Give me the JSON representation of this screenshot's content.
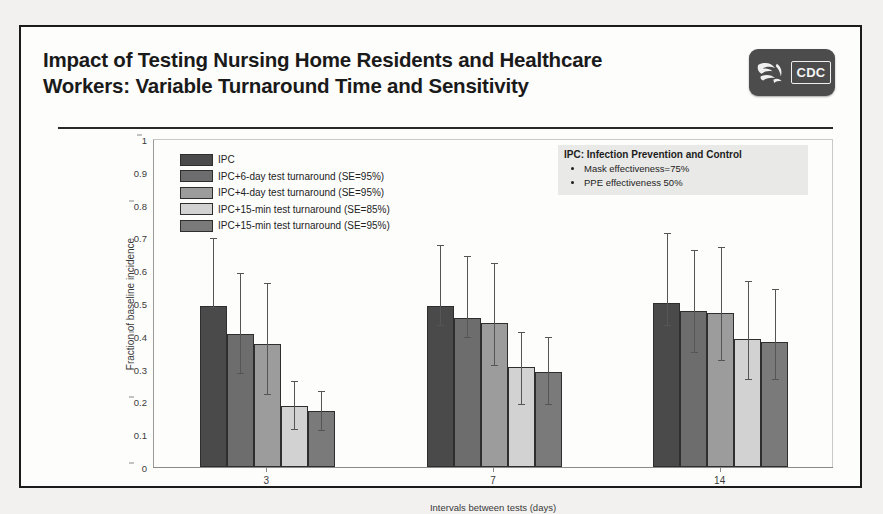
{
  "slide": {
    "title": "Impact of Testing Nursing Home Residents and Healthcare\nWorkers: Variable Turnaround Time and Sensitivity",
    "logo_text": "CDC"
  },
  "annotation": {
    "title": "IPC: Infection Prevention and Control",
    "bullets": [
      "Mask effectiveness=75%",
      "PPE effectiveness 50%"
    ]
  },
  "chart_data": {
    "type": "bar",
    "title": "",
    "xlabel": "Intervals between tests (days)",
    "ylabel": "Fraction of baseline incidence",
    "categories": [
      "3",
      "7",
      "14"
    ],
    "ylim": [
      0,
      1
    ],
    "yticks": [
      "0",
      "0.1",
      "0.2",
      "0.3",
      "0.4",
      "0.5",
      "0.6",
      "0.7",
      "0.8",
      "0.9",
      "1"
    ],
    "grid": false,
    "legend_position": "upper-left inside",
    "series": [
      {
        "name": "IPC",
        "color": "#4a4a4a",
        "values": [
          0.49,
          0.49,
          0.5
        ],
        "err_low": [
          0.49,
          0.435,
          0.435
        ],
        "err_high": [
          0.7,
          0.68,
          0.715
        ]
      },
      {
        "name": "IPC+6-day test turnaround (SE=95%)",
        "color": "#6d6d6d",
        "values": [
          0.405,
          0.455,
          0.475
        ],
        "err_low": [
          0.29,
          0.4,
          0.355
        ],
        "err_high": [
          0.595,
          0.645,
          0.665
        ]
      },
      {
        "name": "IPC+4-day test turnaround (SE=95%)",
        "color": "#9c9c9c",
        "values": [
          0.375,
          0.44,
          0.47
        ],
        "err_low": [
          0.225,
          0.315,
          0.33
        ],
        "err_high": [
          0.565,
          0.625,
          0.675
        ]
      },
      {
        "name": "IPC+15-min test turnaround (SE=85%)",
        "color": "#d2d2d2",
        "values": [
          0.185,
          0.305,
          0.39
        ],
        "err_low": [
          0.12,
          0.195,
          0.27
        ],
        "err_high": [
          0.265,
          0.415,
          0.57
        ]
      },
      {
        "name": "IPC+15-min test turnaround (SE=95%)",
        "color": "#7a7a7a",
        "values": [
          0.17,
          0.29,
          0.38
        ],
        "err_low": [
          0.115,
          0.195,
          0.27
        ],
        "err_high": [
          0.235,
          0.4,
          0.545
        ]
      }
    ]
  }
}
